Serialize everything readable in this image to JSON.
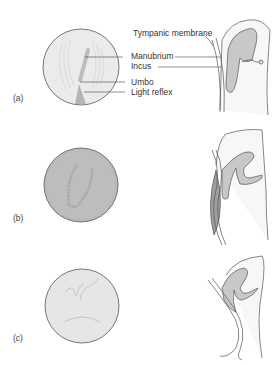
{
  "figure": {
    "panels": [
      {
        "id": "a",
        "label": "(a)",
        "otoscopic_view": {
          "fill": "#ebebeb",
          "description": "normal tympanic membrane"
        },
        "annotations": [
          {
            "text": "Tympanic membrane"
          },
          {
            "text": "Manubrium"
          },
          {
            "text": "Incus"
          },
          {
            "text": "Umbo"
          },
          {
            "text": "Light reflex"
          }
        ]
      },
      {
        "id": "b",
        "label": "(b)",
        "otoscopic_view": {
          "fill": "#bdbdbd",
          "description": "bulging tympanic membrane"
        }
      },
      {
        "id": "c",
        "label": "(c)",
        "otoscopic_view": {
          "fill": "#e6e6e6",
          "description": "retracted tympanic membrane"
        }
      }
    ],
    "colors": {
      "line": "#555555",
      "ossicle_fill": "#c8c8c8",
      "cavity_fill": "#f2f2f2",
      "effusion_fill": "#9e9e9e"
    }
  }
}
